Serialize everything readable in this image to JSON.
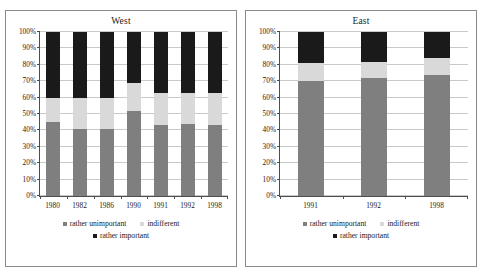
{
  "colors": {
    "unimportant": "#7f7f7f",
    "indifferent": "#d9d9d9",
    "important": "#1a1a1a",
    "axis": "#4d4d4d",
    "grid": "#c9c9c9",
    "panel_border": "#8a8a8a",
    "background": "#ffffff"
  },
  "legend": {
    "unimportant_label": "rather unimportant",
    "indifferent_label": "indifferent",
    "important_label": "rather important"
  },
  "y_axis": {
    "ticks": [
      "0%",
      "10%",
      "20%",
      "30%",
      "40%",
      "50%",
      "60%",
      "70%",
      "80%",
      "90%",
      "100%"
    ]
  },
  "chart_data": [
    {
      "type": "bar",
      "title": "West",
      "stacked": true,
      "xlabel": "",
      "ylabel": "",
      "ylim": [
        0,
        100
      ],
      "grid": true,
      "legend_position": "bottom",
      "categories": [
        "1980",
        "1982",
        "1986",
        "1990",
        "1991",
        "1992",
        "1998"
      ],
      "series": [
        {
          "name": "rather unimportant",
          "color": "#7f7f7f",
          "values": [
            45,
            41,
            41,
            52,
            43,
            44,
            43
          ]
        },
        {
          "name": "indifferent",
          "color": "#d9d9d9",
          "values": [
            15,
            19,
            19,
            17,
            20,
            19,
            20
          ]
        },
        {
          "name": "rather important",
          "color": "#1a1a1a",
          "values": [
            40,
            40,
            40,
            31,
            37,
            37,
            37
          ]
        }
      ]
    },
    {
      "type": "bar",
      "title": "East",
      "stacked": true,
      "xlabel": "",
      "ylabel": "",
      "ylim": [
        0,
        100
      ],
      "grid": true,
      "legend_position": "bottom",
      "categories": [
        "1991",
        "1992",
        "1998"
      ],
      "series": [
        {
          "name": "rather unimportant",
          "color": "#7f7f7f",
          "values": [
            70,
            72,
            74
          ]
        },
        {
          "name": "indifferent",
          "color": "#d9d9d9",
          "values": [
            11,
            10,
            10
          ]
        },
        {
          "name": "rather important",
          "color": "#1a1a1a",
          "values": [
            19,
            18,
            16
          ]
        }
      ]
    }
  ]
}
